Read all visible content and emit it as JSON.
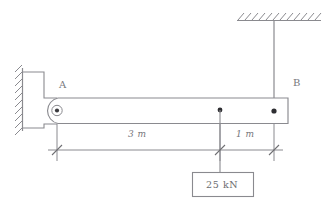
{
  "figure": {
    "stroke_color": "#8a8a8f",
    "stroke_color_dark": "#6f6f73",
    "background": "#ffffff"
  },
  "supports": {
    "wall": {
      "name": "wall-support-left",
      "hatch_label": "wall-hatching"
    },
    "ceiling": {
      "name": "ceiling-support-top",
      "hatch_label": "ceiling-hatching"
    },
    "pin": {
      "name": "pin-support-A"
    }
  },
  "nodes": [
    {
      "id": "A",
      "label": "A",
      "x_px": 57,
      "y_px": 110
    },
    {
      "id": "B",
      "label": "B",
      "x_px": 274,
      "y_px": 111
    }
  ],
  "cable": {
    "name": "cable-BC",
    "label": ""
  },
  "load": {
    "label": "25 kN",
    "magnitude": 25,
    "unit": "kN",
    "position_from_A_m": 3,
    "direction": "down"
  },
  "dimensions": [
    {
      "label": "3 m",
      "value": 3,
      "unit": "m",
      "from": "A",
      "to": "load"
    },
    {
      "label": "1 m",
      "value": 1,
      "unit": "m",
      "from": "load",
      "to": "B"
    }
  ]
}
